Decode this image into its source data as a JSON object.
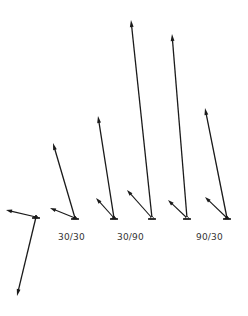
{
  "diagram": {
    "title": "",
    "stroke_color": "#1a1a1a",
    "background": "#ffffff",
    "labels": [
      {
        "text": "30/30",
        "x": 58,
        "y": 237
      },
      {
        "text": "30/90",
        "x": 117,
        "y": 237
      },
      {
        "text": "90/30",
        "x": 196,
        "y": 237
      }
    ],
    "figures": [
      {
        "id": "fig-a",
        "base": {
          "x": 36,
          "y": 217,
          "marker": "filled"
        },
        "arrows": [
          {
            "kind": "long",
            "to": {
              "x": 17,
              "y": 296
            }
          },
          {
            "kind": "short",
            "to": {
              "x": 6,
              "y": 210
            }
          }
        ]
      },
      {
        "id": "fig-b",
        "group": "30/30",
        "base": {
          "x": 75,
          "y": 218,
          "marker": "filled"
        },
        "arrows": [
          {
            "kind": "long",
            "to": {
              "x": 53,
              "y": 143
            }
          },
          {
            "kind": "short",
            "to": {
              "x": 50,
              "y": 208
            }
          }
        ]
      },
      {
        "id": "fig-c",
        "group": "30/90",
        "base": {
          "x": 114,
          "y": 218,
          "marker": "filled"
        },
        "arrows": [
          {
            "kind": "long",
            "to": {
              "x": 98,
              "y": 116
            }
          },
          {
            "kind": "short",
            "to": {
              "x": 96,
              "y": 198
            }
          }
        ]
      },
      {
        "id": "fig-d",
        "group": "30/90",
        "base": {
          "x": 152,
          "y": 218,
          "marker": "open"
        },
        "arrows": [
          {
            "kind": "long",
            "to": {
              "x": 131,
              "y": 20
            }
          },
          {
            "kind": "short",
            "to": {
              "x": 127,
              "y": 190
            }
          }
        ]
      },
      {
        "id": "fig-e",
        "group": "90/30",
        "base": {
          "x": 187,
          "y": 218,
          "marker": "open"
        },
        "arrows": [
          {
            "kind": "long",
            "to": {
              "x": 172,
              "y": 34
            }
          },
          {
            "kind": "short",
            "to": {
              "x": 168,
              "y": 200
            }
          }
        ]
      },
      {
        "id": "fig-f",
        "group": "90/30",
        "base": {
          "x": 227,
          "y": 218,
          "marker": "filled"
        },
        "arrows": [
          {
            "kind": "long",
            "to": {
              "x": 205,
              "y": 108
            }
          },
          {
            "kind": "short",
            "to": {
              "x": 205,
              "y": 197
            }
          }
        ]
      }
    ]
  }
}
